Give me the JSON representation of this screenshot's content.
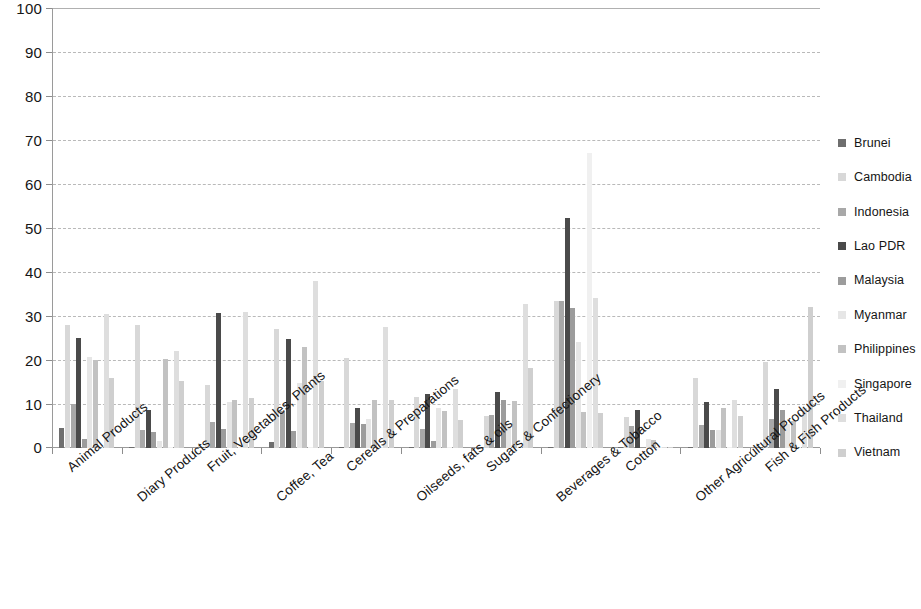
{
  "chart_data": {
    "type": "bar",
    "title": "",
    "subtitle": "",
    "xlabel": "",
    "ylabel": "",
    "ylim": [
      0,
      100
    ],
    "yticks": [
      0,
      10,
      20,
      30,
      40,
      50,
      60,
      70,
      80,
      90,
      100
    ],
    "grid": true,
    "legend_position": "right",
    "grouped": true,
    "categories": [
      "Animal Products",
      "Diary Products",
      "Fruit, Vegetables, Plants",
      "Coffee, Tea",
      "Cereals & Preparations",
      "Oilseeds, fats & oils",
      "Sugars & Confectionery",
      "Beverages & Tobacco",
      "Cotton",
      "Other Agricultural Products",
      "Fish & Fish Products"
    ],
    "series": [
      {
        "name": "Brunei",
        "color": "#6e6e6e",
        "values": [
          4.5,
          0.3,
          0.2,
          1.3,
          0.2,
          0.2,
          0.2,
          0.2,
          0.2,
          0.2,
          0.2
        ]
      },
      {
        "name": "Cambodia",
        "color": "#d8d8d8",
        "values": [
          28.0,
          28.0,
          14.3,
          27.0,
          20.5,
          11.5,
          7.3,
          33.5,
          7.0,
          16.0,
          19.5
        ]
      },
      {
        "name": "Indonesia",
        "color": "#a8a8a8",
        "values": [
          9.9,
          4.0,
          5.8,
          8.3,
          5.7,
          4.3,
          7.5,
          33.5,
          4.9,
          5.3,
          6.5
        ]
      },
      {
        "name": "Lao PDR",
        "color": "#4a4a4a",
        "values": [
          25.0,
          8.7,
          30.6,
          24.7,
          9.2,
          12.2,
          12.8,
          52.3,
          8.7,
          10.5,
          13.4
        ]
      },
      {
        "name": "Malaysia",
        "color": "#9c9c9c",
        "values": [
          2.1,
          3.7,
          4.3,
          3.8,
          5.5,
          1.6,
          10.9,
          31.9,
          0.2,
          4.0,
          8.7
        ]
      },
      {
        "name": "Myanmar",
        "color": "#e6e6e6",
        "values": [
          20.6,
          1.7,
          10.4,
          14.8,
          6.5,
          9.0,
          4.9,
          24.0,
          2.0,
          4.1,
          5.5
        ]
      },
      {
        "name": "Philippines",
        "color": "#c2c2c2",
        "values": [
          20.1,
          20.3,
          10.8,
          23.0,
          10.8,
          8.3,
          10.6,
          8.2,
          1.9,
          9.1,
          6.2
        ]
      },
      {
        "name": "Singapore",
        "color": "#f0f0f0",
        "values": [
          0.2,
          0.2,
          0.2,
          0.2,
          0.2,
          0.2,
          0.2,
          67.0,
          0.2,
          0.2,
          0.2
        ]
      },
      {
        "name": "Thailand",
        "color": "#dedede",
        "values": [
          30.5,
          22.0,
          30.8,
          38.0,
          27.6,
          13.4,
          32.7,
          34.0,
          0.2,
          10.9,
          9.0
        ]
      },
      {
        "name": "Vietnam",
        "color": "#cfcfcf",
        "values": [
          16.0,
          15.3,
          11.4,
          15.2,
          11.0,
          6.4,
          18.2,
          7.9,
          0.2,
          7.2,
          32.0
        ]
      }
    ],
    "notes": {
      "clipped_at_max": [
        "Cambodia Beverages & Tobacco",
        "Indonesia Beverages & Tobacco"
      ],
      "clipped_value_label": "100+"
    }
  },
  "legend": {
    "items": [
      {
        "label": "Brunei",
        "color": "#6e6e6e"
      },
      {
        "label": "Cambodia",
        "color": "#d8d8d8"
      },
      {
        "label": "Indonesia",
        "color": "#a8a8a8"
      },
      {
        "label": "Lao PDR",
        "color": "#4a4a4a"
      },
      {
        "label": "Malaysia",
        "color": "#9c9c9c"
      },
      {
        "label": "Myanmar",
        "color": "#e6e6e6"
      },
      {
        "label": "Philippines",
        "color": "#c2c2c2"
      },
      {
        "label": "Singapore",
        "color": "#f0f0f0"
      },
      {
        "label": "Thailand",
        "color": "#dedede"
      },
      {
        "label": "Vietnam",
        "color": "#cfcfcf"
      }
    ]
  },
  "axes": {
    "y_tick_labels": [
      "0",
      "10",
      "20",
      "30",
      "40",
      "50",
      "60",
      "70",
      "80",
      "90",
      "100"
    ],
    "x_tick_labels": [
      "Animal Products",
      "Diary Products",
      "Fruit, Vegetables, Plants",
      "Coffee, Tea",
      "Cereals & Preparations",
      "Oilseeds, fats & oils",
      "Sugars & Confectionery",
      "Beverages & Tobacco",
      "Cotton",
      "Other Agricultural Products",
      "Fish & Fish Products"
    ]
  }
}
